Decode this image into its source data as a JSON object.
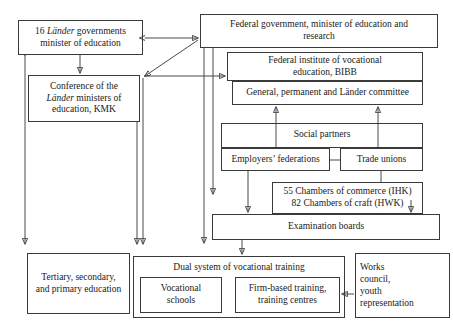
{
  "diagram": {
    "type": "organizational-flow-diagram",
    "canvas": {
      "width": 453,
      "height": 334
    },
    "stroke_color": "#4a4a4a",
    "text_color": "#1a1a1a",
    "background_color": "#ffffff",
    "nodes": [
      {
        "id": "laender-governments",
        "label": "16 Länder governments\nminister of education",
        "emphasis_word": "Länder",
        "x": 18,
        "y": 20,
        "w": 125,
        "h": 35
      },
      {
        "id": "federal-government",
        "label": "Federal government, minister of education and\nresearch",
        "x": 200,
        "y": 14,
        "w": 238,
        "h": 34
      },
      {
        "id": "kmk",
        "label": "Conference of the\nLänder ministers of\neducation, KMK",
        "emphasis_word": "Länder",
        "x": 28,
        "y": 75,
        "w": 112,
        "h": 47
      },
      {
        "id": "bibb",
        "label": "Federal institute of vocational\neducation, BIBB",
        "x": 227,
        "y": 52,
        "w": 196,
        "h": 29
      },
      {
        "id": "committee",
        "label": "General, permanent and Länder committee",
        "x": 232,
        "y": 81,
        "w": 191,
        "h": 24
      },
      {
        "id": "social-partners",
        "label": "Social partners",
        "x": 221,
        "y": 123,
        "w": 202,
        "h": 25
      },
      {
        "id": "employers-federations",
        "label": "Employers’ federations",
        "x": 221,
        "y": 148,
        "w": 109,
        "h": 23
      },
      {
        "id": "trade-unions",
        "label": "Trade unions",
        "x": 340,
        "y": 148,
        "w": 83,
        "h": 23
      },
      {
        "id": "chambers",
        "label": "55 Chambers of commerce (IHK)\n82 Chambers of craft (HWK)",
        "x": 272,
        "y": 182,
        "w": 151,
        "h": 32
      },
      {
        "id": "examination-boards",
        "label": "Examination boards",
        "x": 212,
        "y": 214,
        "w": 228,
        "h": 26
      },
      {
        "id": "tertiary-secondary-primary",
        "label": "Tertiary, secondary,\nand primary education",
        "x": 27,
        "y": 253,
        "w": 103,
        "h": 61
      },
      {
        "id": "dual-system",
        "label": "Dual system of vocational training",
        "x": 133,
        "y": 256,
        "w": 212,
        "h": 62
      },
      {
        "id": "vocational-schools",
        "label": "Vocational\nschools",
        "x": 140,
        "y": 277,
        "w": 82,
        "h": 36
      },
      {
        "id": "firm-based-training",
        "label": "Firm-based training,\ntraining centres",
        "x": 235,
        "y": 277,
        "w": 105,
        "h": 36
      },
      {
        "id": "works-council",
        "label": "Works\ncouncil,\nyouth\nrepresentation",
        "x": 355,
        "y": 253,
        "w": 95,
        "h": 65
      }
    ],
    "connections": [
      {
        "from": "federal-government",
        "to": "laender-governments",
        "kind": "double-headed-horizontal"
      },
      {
        "from": "federal-government",
        "to": "kmk",
        "kind": "diagonal"
      },
      {
        "from": "kmk",
        "to": "bibb",
        "kind": "horizontal"
      },
      {
        "from": "laender-governments",
        "to": "kmk",
        "kind": "vertical"
      },
      {
        "from": "laender-governments",
        "to": "tertiary-secondary-primary",
        "kind": "vertical"
      },
      {
        "from": "kmk",
        "to": "dual-system",
        "kind": "vertical"
      },
      {
        "from": "federal-government",
        "to": "examination-boards",
        "kind": "vertical"
      },
      {
        "from": "federal-government",
        "to": "chambers",
        "kind": "vertical"
      },
      {
        "from": "social-partners",
        "to": "committee",
        "kind": "vertical-up-left"
      },
      {
        "from": "social-partners",
        "to": "committee",
        "kind": "vertical-up-right"
      },
      {
        "from": "employers-federations",
        "to": "examination-boards",
        "kind": "vertical"
      },
      {
        "from": "trade-unions",
        "to": "chambers",
        "kind": "vertical"
      },
      {
        "from": "chambers",
        "to": "examination-boards",
        "kind": "vertical-short"
      },
      {
        "from": "examination-boards",
        "to": "dual-system",
        "kind": "vertical"
      },
      {
        "from": "works-council",
        "to": "firm-based-training",
        "kind": "horizontal-left"
      }
    ]
  }
}
